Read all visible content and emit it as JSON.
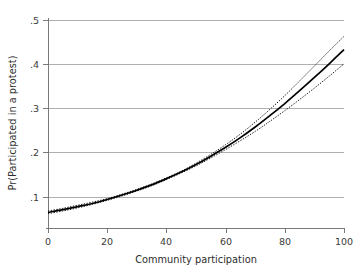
{
  "chart_data": {
    "type": "line",
    "title": "",
    "xlabel": "Community participation",
    "ylabel": "Pr(Participated in a protest)",
    "xlim": [
      0,
      100
    ],
    "ylim": [
      0.0295,
      0.5
    ],
    "grid": "horizontal",
    "legend": "none",
    "xticks": [
      0,
      20,
      40,
      60,
      80,
      100
    ],
    "xtick_labels": [
      "0",
      "20",
      "40",
      "60",
      "80",
      "100"
    ],
    "yticks": [
      0.1,
      0.2,
      0.3,
      0.4,
      0.5
    ],
    "ytick_labels": [
      ".1",
      ".2",
      ".3",
      ".4",
      ".5"
    ],
    "x": [
      0,
      5,
      10,
      15,
      20,
      25,
      30,
      35,
      40,
      45,
      50,
      55,
      60,
      65,
      70,
      75,
      80,
      85,
      90,
      95,
      100
    ],
    "series": [
      {
        "name": "Predicted probability",
        "style": "solid",
        "color": "#000000",
        "values": [
          0.065,
          0.071,
          0.078,
          0.085,
          0.094,
          0.104,
          0.115,
          0.127,
          0.141,
          0.156,
          0.173,
          0.192,
          0.212,
          0.234,
          0.258,
          0.284,
          0.311,
          0.34,
          0.37,
          0.401,
          0.433
        ]
      },
      {
        "name": "95% CI upper",
        "style": "dotted",
        "color": "#1a1a1a",
        "values": [
          0.068,
          0.074,
          0.081,
          0.088,
          0.096,
          0.106,
          0.117,
          0.129,
          0.143,
          0.158,
          0.176,
          0.196,
          0.218,
          0.242,
          0.269,
          0.298,
          0.329,
          0.362,
          0.396,
          0.43,
          0.463
        ]
      },
      {
        "name": "95% CI lower",
        "style": "dotted",
        "color": "#1a1a1a",
        "values": [
          0.062,
          0.068,
          0.075,
          0.083,
          0.092,
          0.102,
          0.113,
          0.125,
          0.139,
          0.154,
          0.17,
          0.188,
          0.207,
          0.227,
          0.248,
          0.271,
          0.295,
          0.32,
          0.346,
          0.373,
          0.401
        ]
      }
    ]
  },
  "axes": {
    "y_axis_label": "Pr(Participated in a protest)",
    "x_axis_label": "Community participation",
    "y_tick_labels": [
      ".1",
      ".2",
      ".3",
      ".4",
      ".5"
    ],
    "x_tick_labels": [
      "0",
      "20",
      "40",
      "60",
      "80",
      "100"
    ]
  },
  "colors": {
    "background": "#ffffff",
    "grid": "#8d8d8d",
    "axis": "#6b6b6b",
    "fit": "#000000",
    "ci": "#1a1a1a",
    "text": "#2e2e2e"
  }
}
